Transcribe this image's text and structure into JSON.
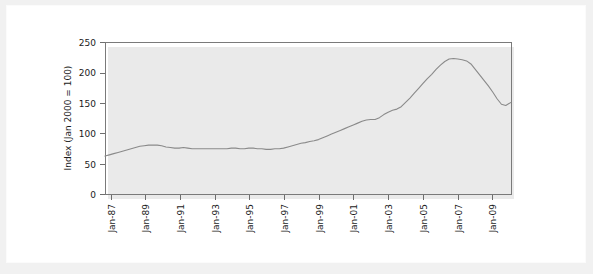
{
  "chart_data": {
    "type": "line",
    "title": "",
    "subtitle": "",
    "xlabel": "",
    "ylabel": "Index (Jan 2000 = 100)",
    "ylim": [
      0,
      250
    ],
    "ytick_labels": [
      "0",
      "50",
      "100",
      "150",
      "200",
      "250"
    ],
    "ytick_values": [
      0,
      50,
      100,
      150,
      200,
      250
    ],
    "xtick_labels": [
      "Jan-87",
      "Jan-89",
      "Jan-91",
      "Jan-93",
      "Jan-95",
      "Jan-97",
      "Jan-99",
      "Jan-01",
      "Jan-03",
      "Jan-05",
      "Jan-07",
      "Jan-09"
    ],
    "xtick_values": [
      1987,
      1989,
      1991,
      1993,
      1995,
      1997,
      1999,
      2001,
      2003,
      2005,
      2007,
      2009
    ],
    "xlim": [
      1987,
      2010.3
    ],
    "grid": false,
    "legend": false,
    "legend_position": "none",
    "line_color": "#8a8a8a",
    "series": [
      {
        "name": "Index (Jan 2000 = 100)",
        "x": [
          1987.0,
          1987.25,
          1987.5,
          1987.75,
          1988.0,
          1988.25,
          1988.5,
          1988.75,
          1989.0,
          1989.25,
          1989.5,
          1989.75,
          1990.0,
          1990.25,
          1990.5,
          1990.75,
          1991.0,
          1991.25,
          1991.5,
          1991.75,
          1992.0,
          1992.25,
          1992.5,
          1992.75,
          1993.0,
          1993.25,
          1993.5,
          1993.75,
          1994.0,
          1994.25,
          1994.5,
          1994.75,
          1995.0,
          1995.25,
          1995.5,
          1995.75,
          1996.0,
          1996.25,
          1996.5,
          1996.75,
          1997.0,
          1997.25,
          1997.5,
          1997.75,
          1998.0,
          1998.25,
          1998.5,
          1998.75,
          1999.0,
          1999.25,
          1999.5,
          1999.75,
          2000.0,
          2000.25,
          2000.5,
          2000.75,
          2001.0,
          2001.25,
          2001.5,
          2001.75,
          2002.0,
          2002.25,
          2002.5,
          2002.75,
          2003.0,
          2003.25,
          2003.5,
          2003.75,
          2004.0,
          2004.25,
          2004.5,
          2004.75,
          2005.0,
          2005.25,
          2005.5,
          2005.75,
          2006.0,
          2006.25,
          2006.5,
          2006.75,
          2007.0,
          2007.25,
          2007.5,
          2007.75,
          2008.0,
          2008.25,
          2008.5,
          2008.75,
          2009.0,
          2009.25,
          2009.5,
          2009.75,
          2010.0,
          2010.3
        ],
        "values": [
          63,
          65,
          67,
          69,
          71,
          73,
          75,
          77,
          79,
          80,
          81,
          81,
          81,
          80,
          78,
          77,
          76,
          76,
          77,
          76,
          75,
          75,
          75,
          75,
          75,
          75,
          75,
          75,
          75,
          76,
          76,
          75,
          75,
          76,
          76,
          75,
          75,
          74,
          74,
          75,
          75,
          76,
          78,
          80,
          82,
          84,
          85,
          87,
          88,
          90,
          93,
          96,
          99,
          102,
          105,
          108,
          111,
          114,
          117,
          120,
          122,
          123,
          123,
          126,
          131,
          135,
          138,
          140,
          144,
          151,
          158,
          166,
          174,
          182,
          190,
          197,
          205,
          212,
          218,
          222,
          223,
          222,
          221,
          219,
          214,
          205,
          196,
          187,
          178,
          168,
          157,
          148,
          146,
          151
        ]
      }
    ]
  },
  "axis": {
    "ytick_anchor": "right",
    "xtick_rotation": "-90"
  }
}
